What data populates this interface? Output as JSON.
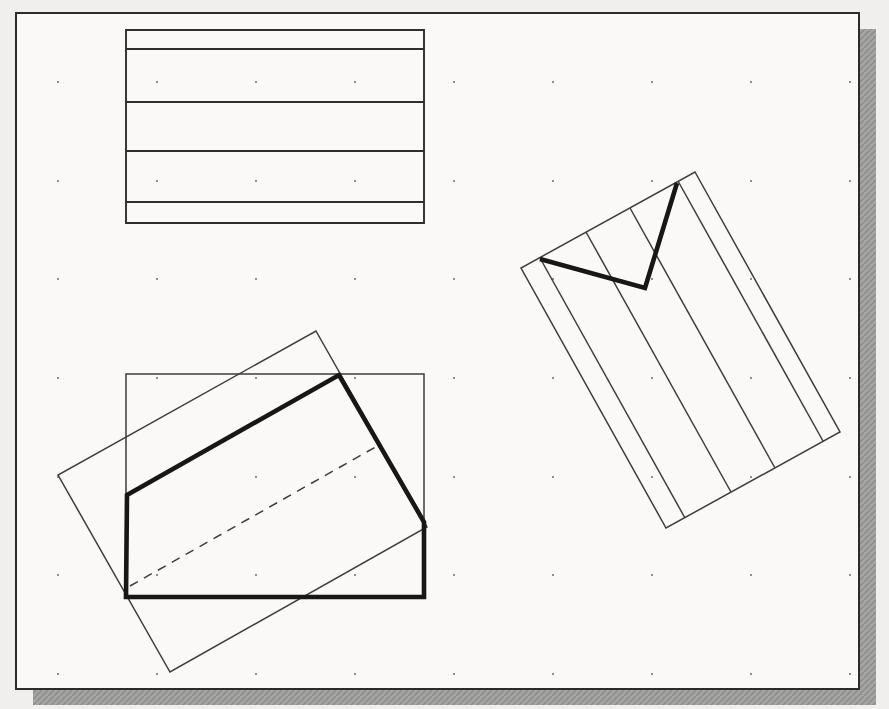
{
  "page_background": "#f0efed",
  "canvas": {
    "x": 16,
    "y": 13,
    "width": 843,
    "height": 676,
    "fill": "#faf9f7",
    "border_color": "#2c2c2a",
    "border_width": 2,
    "shadow": {
      "offset_x": 17,
      "offset_y": 16,
      "color": "#a4a4a2",
      "hatch_color": "#8b8b89"
    }
  },
  "grid": {
    "dot_color": "#8f8f91",
    "dot_size": 2,
    "columns": [
      58,
      157,
      256,
      355,
      454,
      553,
      652,
      751,
      850
    ],
    "rows": [
      82,
      181,
      279,
      378,
      477,
      575,
      674
    ]
  },
  "line_styles": {
    "thin": {
      "stroke": "#3d3d3b",
      "width": 1.5
    },
    "medium": {
      "stroke": "#2e2e2c",
      "width": 1.9
    },
    "dashed": {
      "stroke": "#3d3d3b",
      "width": 1.5,
      "dash": "9 7"
    },
    "thick": {
      "stroke": "#171717",
      "width": 4.6
    }
  },
  "shapes": [
    {
      "name": "striped-rectangle-outline",
      "type": "polygon",
      "style": "medium",
      "points": [
        [
          126,
          30
        ],
        [
          424,
          30
        ],
        [
          424,
          223
        ],
        [
          126,
          223
        ]
      ]
    },
    {
      "name": "striped-rectangle-divider-1",
      "type": "line",
      "style": "medium",
      "x1": 126,
      "y1": 49,
      "x2": 424,
      "y2": 49
    },
    {
      "name": "striped-rectangle-divider-2",
      "type": "line",
      "style": "medium",
      "x1": 126,
      "y1": 102,
      "x2": 424,
      "y2": 102
    },
    {
      "name": "striped-rectangle-divider-3",
      "type": "line",
      "style": "medium",
      "x1": 126,
      "y1": 151,
      "x2": 424,
      "y2": 151
    },
    {
      "name": "striped-rectangle-divider-4",
      "type": "line",
      "style": "medium",
      "x1": 126,
      "y1": 202,
      "x2": 424,
      "y2": 202
    },
    {
      "name": "rotated-striped-rectangle-outline",
      "type": "polygon",
      "style": "thin",
      "points": [
        [
          695,
          172
        ],
        [
          840,
          432
        ],
        [
          666,
          528
        ],
        [
          521,
          268
        ]
      ]
    },
    {
      "name": "rotated-stripe-1",
      "type": "line",
      "style": "thin",
      "x1": 678,
      "y1": 181,
      "x2": 823,
      "y2": 441
    },
    {
      "name": "rotated-stripe-2",
      "type": "line",
      "style": "thin",
      "x1": 630,
      "y1": 208,
      "x2": 775,
      "y2": 468
    },
    {
      "name": "rotated-stripe-3",
      "type": "line",
      "style": "thin",
      "x1": 586,
      "y1": 232,
      "x2": 731,
      "y2": 492
    },
    {
      "name": "rotated-stripe-4",
      "type": "line",
      "style": "thin",
      "x1": 540,
      "y1": 258,
      "x2": 685,
      "y2": 518
    },
    {
      "name": "base-rectangle",
      "type": "polygon",
      "style": "thin",
      "points": [
        [
          126,
          374
        ],
        [
          424,
          374
        ],
        [
          424,
          597
        ],
        [
          126,
          597
        ]
      ]
    },
    {
      "name": "rotated-rectangle",
      "type": "polygon",
      "style": "thin",
      "points": [
        [
          316,
          331
        ],
        [
          427,
          527
        ],
        [
          170,
          672
        ],
        [
          58,
          475
        ]
      ]
    },
    {
      "name": "dashed-line",
      "type": "line",
      "style": "dashed",
      "x1": 130,
      "y1": 586,
      "x2": 379,
      "y2": 445
    },
    {
      "name": "checkmark-polyline",
      "type": "polyline",
      "style": "thick",
      "points": [
        [
          540,
          259
        ],
        [
          645,
          288
        ],
        [
          677,
          183
        ]
      ]
    },
    {
      "name": "highlight-polygon",
      "type": "polygon",
      "style": "thick",
      "points": [
        [
          127,
          495
        ],
        [
          339,
          375
        ],
        [
          424,
          522
        ],
        [
          424,
          597
        ],
        [
          126,
          597
        ]
      ]
    }
  ]
}
